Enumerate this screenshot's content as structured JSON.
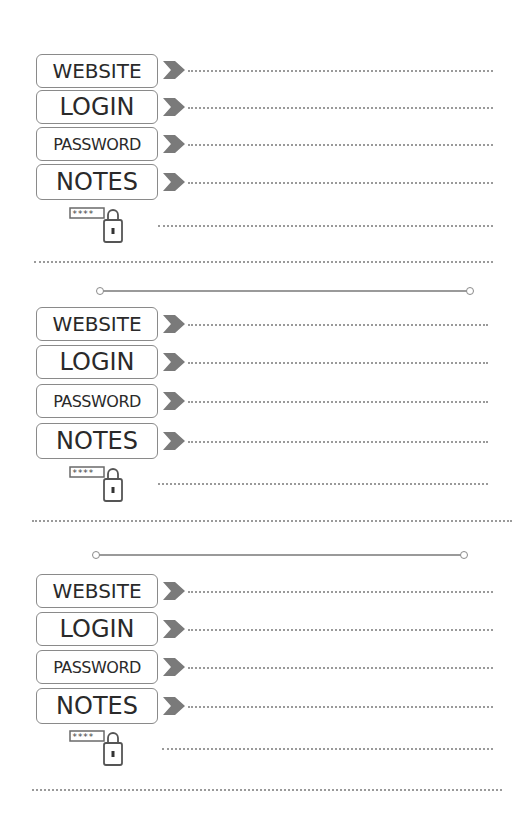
{
  "entries": [
    {
      "fields": [
        {
          "label": "WEBSITE",
          "value": ""
        },
        {
          "label": "LOGIN",
          "value": ""
        },
        {
          "label": "PASSWORD",
          "value": ""
        },
        {
          "label": "NOTES",
          "value": ""
        }
      ],
      "lock_icon": "password-lock-icon",
      "password_mask": "****"
    },
    {
      "fields": [
        {
          "label": "WEBSITE",
          "value": ""
        },
        {
          "label": "LOGIN",
          "value": ""
        },
        {
          "label": "PASSWORD",
          "value": ""
        },
        {
          "label": "NOTES",
          "value": ""
        }
      ],
      "lock_icon": "password-lock-icon",
      "password_mask": "****"
    },
    {
      "fields": [
        {
          "label": "WEBSITE",
          "value": ""
        },
        {
          "label": "LOGIN",
          "value": ""
        },
        {
          "label": "PASSWORD",
          "value": ""
        },
        {
          "label": "NOTES",
          "value": ""
        }
      ],
      "lock_icon": "password-lock-icon",
      "password_mask": "****"
    }
  ],
  "colors": {
    "border": "#8a8a8a",
    "arrow": "#7a7a7a",
    "dots": "#9a9a9a",
    "text": "#2a2a2a"
  }
}
